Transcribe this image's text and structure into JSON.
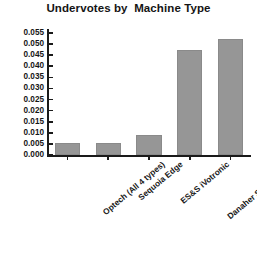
{
  "chart_data": {
    "type": "bar",
    "title": "Undervotes by  Machine Type",
    "xlabel": "",
    "ylabel": "",
    "categories": [
      "Optech (All 4 types)",
      "Sequoia Edge",
      "ES&S iVotronic",
      "Danaher Shouptronic",
      "Sequoia Advantage"
    ],
    "values": [
      0.0055,
      0.0055,
      0.009,
      0.0475,
      0.0525
    ],
    "ylim": [
      0.0,
      0.055
    ],
    "ytick_step": 0.005,
    "ytick_labels": [
      "0.000",
      "0.005",
      "0.010",
      "0.015",
      "0.020",
      "0.025",
      "0.030",
      "0.035",
      "0.040",
      "0.045",
      "0.050",
      "0.055"
    ],
    "ytick_values": [
      0.0,
      0.005,
      0.01,
      0.015,
      0.02,
      0.025,
      0.03,
      0.035,
      0.04,
      0.045,
      0.05,
      0.055
    ],
    "grid": false,
    "legend": false,
    "bar_color": "#969696",
    "axis_color": "#1a1a1a",
    "background": "#ffffff",
    "label_rotation_deg": -40
  }
}
